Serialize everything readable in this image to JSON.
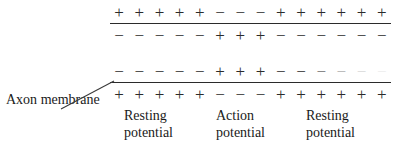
{
  "figure": {
    "background_color": "#ffffff",
    "ink_color": "#2b2b2b"
  },
  "axon_label": {
    "line1": "Axon",
    "line2": "membrane"
  },
  "membranes": [
    {
      "id": "upper",
      "outer_charges": [
        "+",
        "+",
        "+",
        "+",
        "+",
        "−",
        "−",
        "−",
        "+",
        "+",
        "+",
        "+",
        "+",
        "+"
      ],
      "inner_charges": [
        "−",
        "−",
        "−",
        "−",
        "−",
        "+",
        "+",
        "+",
        "−",
        "−",
        "−",
        "−",
        "−",
        "−"
      ]
    },
    {
      "id": "lower",
      "outer_charges": [
        "−",
        "−",
        "−",
        "−",
        "−",
        "+",
        "+",
        "+",
        "−",
        "−",
        "−",
        "−",
        "−",
        "−"
      ],
      "inner_charges": [
        "+",
        "+",
        "+",
        "+",
        "+",
        "−",
        "−",
        "−",
        "+",
        "+",
        "+",
        "+",
        "+",
        "+"
      ]
    }
  ],
  "captions": [
    {
      "line1": "Resting",
      "line2": "potential"
    },
    {
      "line1": "Action",
      "line2": "potential"
    },
    {
      "line1": "Resting",
      "line2": "potential"
    }
  ]
}
